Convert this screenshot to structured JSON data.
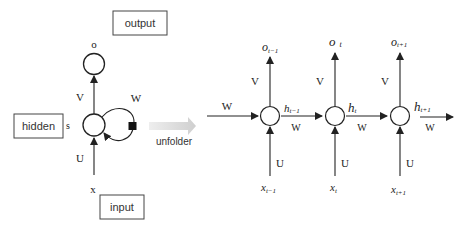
{
  "folded": {
    "boxes": {
      "output": "output",
      "hidden": "hidden",
      "input": "input"
    },
    "labels": {
      "o": "o",
      "s": "s",
      "x": "x",
      "V": "V",
      "U": "U",
      "W": "W"
    }
  },
  "transition": {
    "label": "unfolder"
  },
  "unfolded": {
    "incoming_W": "W",
    "steps": [
      {
        "o_base": "o",
        "o_sub": "t−1",
        "h_base": "h",
        "h_sub": "t−1",
        "x_base": "x",
        "x_sub": "t−1",
        "V": "V",
        "U": "U",
        "W": "W"
      },
      {
        "o_base": "o",
        "o_sub": "t",
        "h_base": "h",
        "h_sub": "t",
        "x_base": "x",
        "x_sub": "t",
        "V": "V",
        "U": "U",
        "W": "W"
      },
      {
        "o_base": "o",
        "o_sub": "t+1",
        "h_base": "h",
        "h_sub": "t+1",
        "x_base": "x",
        "x_sub": "t+1",
        "V": "V",
        "U": "U",
        "W": "W"
      }
    ]
  },
  "colors": {
    "stroke": "#222222",
    "arrow_gray": "#d0d0d0"
  }
}
